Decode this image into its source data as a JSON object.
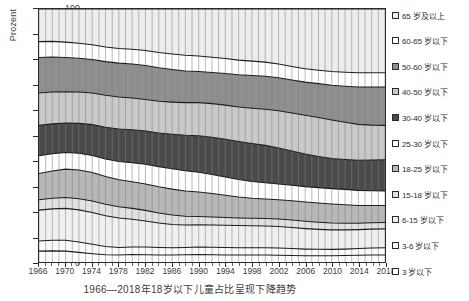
{
  "chart_data": {
    "type": "area",
    "stacked": true,
    "normalized_percent": true,
    "title": "",
    "caption": "1966—2018年18岁以下儿童占比呈现下降趋势",
    "xlabel": "",
    "ylabel": "Prozent",
    "ylim": [
      0,
      100
    ],
    "ytick_labels": [
      "0",
      "10",
      "20",
      "30",
      "40",
      "50",
      "60",
      "70",
      "80",
      "90",
      "100"
    ],
    "ytick_values": [
      0,
      10,
      20,
      30,
      40,
      50,
      60,
      70,
      80,
      90,
      100
    ],
    "xlim": [
      1966,
      2018
    ],
    "xtick_labels": [
      "1966",
      "1970",
      "1974",
      "1978",
      "1982",
      "1986",
      "1990",
      "1994",
      "1998",
      "2002",
      "2006",
      "2010",
      "2014",
      "2018"
    ],
    "xtick_values": [
      1966,
      1970,
      1974,
      1978,
      1982,
      1986,
      1990,
      1994,
      1998,
      2002,
      2006,
      2010,
      2014,
      2018
    ],
    "grid": "vertical-yearly",
    "legend_position": "right",
    "x": [
      1966,
      1968,
      1970,
      1972,
      1974,
      1976,
      1978,
      1980,
      1982,
      1984,
      1986,
      1988,
      1990,
      1992,
      1994,
      1996,
      1998,
      2000,
      2002,
      2004,
      2006,
      2008,
      2010,
      2012,
      2014,
      2016,
      2018
    ],
    "series": [
      {
        "name": "3 岁以下",
        "legend_label": "3 岁以下",
        "color": "#ffffff",
        "order_from_bottom": 1,
        "values": [
          4.3,
          4.4,
          4.3,
          3.8,
          3.3,
          2.9,
          2.8,
          3.0,
          2.9,
          2.8,
          2.8,
          2.9,
          3.0,
          2.9,
          2.8,
          2.8,
          2.8,
          2.8,
          2.7,
          2.6,
          2.5,
          2.5,
          2.5,
          2.6,
          2.7,
          2.8,
          2.8
        ]
      },
      {
        "name": "3-6 岁以下",
        "legend_label": "3-6 岁以下",
        "color": "#fbfbfb",
        "order_from_bottom": 2,
        "values": [
          4.0,
          4.2,
          4.3,
          4.1,
          3.7,
          3.2,
          2.9,
          2.9,
          3.0,
          2.9,
          2.8,
          2.8,
          2.9,
          2.9,
          2.9,
          2.8,
          2.8,
          2.8,
          2.8,
          2.7,
          2.6,
          2.5,
          2.5,
          2.5,
          2.6,
          2.7,
          2.8
        ]
      },
      {
        "name": "6-15 岁以下",
        "legend_label": "6-15 岁以下",
        "color": "#f0f0f0",
        "order_from_bottom": 3,
        "values": [
          12.2,
          12.4,
          12.6,
          12.7,
          12.6,
          12.2,
          11.7,
          11.0,
          10.3,
          9.7,
          9.2,
          8.9,
          8.8,
          8.8,
          8.8,
          8.8,
          8.7,
          8.6,
          8.5,
          8.3,
          8.1,
          7.9,
          7.7,
          7.6,
          7.5,
          7.5,
          7.5
        ]
      },
      {
        "name": "15-18 岁以下",
        "legend_label": "15-18 岁以下",
        "color": "#e2e2e2",
        "order_from_bottom": 4,
        "values": [
          4.1,
          4.2,
          4.3,
          4.4,
          4.5,
          4.5,
          4.4,
          4.3,
          4.2,
          4.0,
          3.8,
          3.5,
          3.3,
          3.2,
          3.1,
          3.0,
          3.0,
          3.0,
          3.0,
          3.0,
          2.9,
          2.8,
          2.7,
          2.6,
          2.5,
          2.5,
          2.5
        ]
      },
      {
        "name": "18-25 岁以下",
        "legend_label": "18-25 岁以下",
        "color": "#b8b8b8",
        "order_from_bottom": 5,
        "values": [
          10.4,
          10.8,
          11.2,
          11.4,
          11.3,
          11.0,
          10.7,
          10.5,
          10.4,
          10.3,
          10.2,
          10.0,
          9.7,
          9.3,
          8.8,
          8.3,
          7.9,
          7.7,
          7.6,
          7.6,
          7.6,
          7.6,
          7.5,
          7.3,
          7.0,
          6.8,
          6.7
        ]
      },
      {
        "name": "25-30 岁以下",
        "legend_label": "25-30 岁以下",
        "color": "#ffffff",
        "order_from_bottom": 6,
        "values": [
          7.0,
          6.8,
          6.6,
          6.6,
          6.7,
          6.9,
          7.2,
          7.5,
          7.8,
          8.0,
          8.1,
          8.0,
          7.8,
          7.5,
          7.2,
          6.9,
          6.6,
          6.4,
          6.2,
          6.1,
          6.1,
          6.1,
          6.1,
          6.1,
          6.0,
          5.9,
          5.8
        ]
      },
      {
        "name": "30-40 岁以下",
        "legend_label": "30-40 岁以下",
        "color": "#4a4a4a",
        "order_from_bottom": 7,
        "values": [
          12.0,
          11.8,
          11.6,
          11.8,
          12.2,
          12.6,
          12.9,
          13.1,
          13.2,
          13.3,
          13.6,
          14.0,
          14.4,
          14.7,
          14.9,
          15.0,
          15.0,
          14.8,
          14.3,
          13.6,
          12.9,
          12.3,
          11.9,
          11.8,
          11.9,
          12.1,
          12.3
        ]
      },
      {
        "name": "40-50 岁以下",
        "legend_label": "40-50 岁以下",
        "color": "#c9c9c9",
        "order_from_bottom": 8,
        "values": [
          12.8,
          12.6,
          12.4,
          12.4,
          12.5,
          12.6,
          12.6,
          12.5,
          12.4,
          12.5,
          12.7,
          12.9,
          13.1,
          13.3,
          13.5,
          13.7,
          14.0,
          14.3,
          14.7,
          15.0,
          15.3,
          15.4,
          15.2,
          14.7,
          14.2,
          13.8,
          13.6
        ]
      },
      {
        "name": "50-60 岁以下",
        "legend_label": "50-60 岁以下",
        "color": "#8f8f8f",
        "order_from_bottom": 9,
        "values": [
          14.0,
          13.8,
          13.5,
          13.3,
          13.2,
          13.3,
          13.4,
          13.5,
          13.5,
          13.3,
          12.9,
          12.5,
          12.3,
          12.3,
          12.5,
          12.7,
          12.9,
          13.0,
          13.0,
          13.0,
          13.1,
          13.4,
          13.8,
          14.3,
          14.8,
          15.1,
          15.2
        ]
      },
      {
        "name": "60-65 岁以下",
        "legend_label": "60-65 岁以下",
        "color": "#ffffff",
        "order_from_bottom": 10,
        "values": [
          6.3,
          6.2,
          6.1,
          6.0,
          5.9,
          5.8,
          5.8,
          5.8,
          5.9,
          6.0,
          6.1,
          6.2,
          6.1,
          6.0,
          5.9,
          5.8,
          5.7,
          5.6,
          5.5,
          5.4,
          5.3,
          5.3,
          5.4,
          5.5,
          5.6,
          5.6,
          5.6
        ]
      },
      {
        "name": "65 岁及以上",
        "legend_label": "65 岁及以上",
        "color": "#ededed",
        "order_from_bottom": 11,
        "values": [
          12.9,
          12.8,
          13.1,
          13.5,
          14.1,
          15.0,
          15.6,
          15.9,
          16.4,
          17.2,
          17.8,
          18.3,
          18.6,
          19.1,
          19.6,
          20.2,
          20.6,
          21.0,
          21.7,
          22.7,
          23.6,
          24.2,
          24.7,
          25.0,
          25.2,
          25.2,
          25.2
        ]
      }
    ],
    "legend_entries": [
      "65 岁及以上",
      "60-65 岁以下",
      "50-60 岁以下",
      "40-50 岁以下",
      "30-40 岁以下",
      "25-30 岁以下",
      "18-25 岁以下",
      "15-18 岁以下",
      "6-15 岁以下",
      "3-6 岁以下",
      "3 岁以下"
    ]
  }
}
